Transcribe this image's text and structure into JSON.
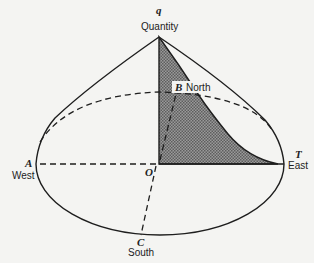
{
  "diagram": {
    "type": "quantity-cone (demand cone over a circular market)",
    "apex": {
      "letter": "q",
      "label": "Quantity"
    },
    "points": {
      "A": {
        "letter": "A",
        "label": "West"
      },
      "B": {
        "letter": "B",
        "label": "North"
      },
      "C": {
        "letter": "C",
        "label": "South"
      },
      "T": {
        "letter": "T",
        "label": "East"
      },
      "O": {
        "letter": "O",
        "label": ""
      }
    },
    "colors": {
      "line": "#1e1e1e",
      "shade": "#7a7a7a",
      "background": "#f4f4f2"
    }
  }
}
